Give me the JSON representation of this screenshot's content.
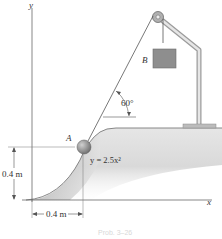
{
  "diagram": {
    "axes": {
      "x_label": "x",
      "y_label": "y"
    },
    "curve_equation": "y = 2.5x²",
    "angle_label": "60°",
    "ball_label": "A",
    "block_label": "B",
    "dimensions": {
      "vertical": "0.4 m",
      "horizontal": "0.4 m"
    },
    "caption": "Prob. 3–26",
    "colors": {
      "ground_fill": "#d4d4d4",
      "ground_shadow": "#9a9a9a",
      "block_fill": "#8e8e8e",
      "ball_fill": "#8a8a8a",
      "frame": "#bdbdbd",
      "line": "#444444"
    }
  }
}
